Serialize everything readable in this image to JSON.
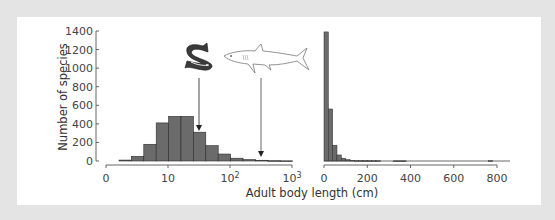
{
  "chart_data": [
    {
      "type": "bar",
      "panel": "left",
      "title": "",
      "xlabel": "Adult body length (cm)",
      "ylabel": "Number of species",
      "x_scale": "log",
      "x_tick_labels": [
        "0",
        "10",
        "10²",
        "10³"
      ],
      "y_tick_labels": [
        "0",
        "200",
        "400",
        "600",
        "800",
        "1000",
        "1200",
        "1400"
      ],
      "ylim": [
        0,
        1400
      ],
      "grid": false,
      "categories": [
        "b1",
        "b2",
        "b3",
        "b4",
        "b5",
        "b6",
        "b7",
        "b8",
        "b9",
        "b10",
        "b11",
        "b12",
        "b13",
        "b14"
      ],
      "values": [
        10,
        50,
        180,
        410,
        480,
        480,
        310,
        165,
        75,
        30,
        15,
        8,
        4,
        2
      ],
      "annotations": [
        {
          "label": "fish (salmon)",
          "arrow_to_bar": 7
        },
        {
          "label": "shark",
          "arrow_to_bar": 12
        }
      ]
    },
    {
      "type": "bar",
      "panel": "right",
      "title": "",
      "xlabel": "Adult body length (cm)",
      "ylabel": "Number of species",
      "x_scale": "linear",
      "x_tick_labels": [
        "0",
        "200",
        "400",
        "600",
        "800"
      ],
      "xlim": [
        0,
        850
      ],
      "ylim": [
        0,
        1400
      ],
      "bin_width": 20,
      "x": [
        0,
        20,
        40,
        60,
        80,
        100,
        120,
        140,
        160,
        180,
        200,
        220,
        240,
        320,
        340,
        360,
        760
      ],
      "values": [
        1390,
        560,
        170,
        65,
        30,
        15,
        8,
        5,
        5,
        4,
        4,
        3,
        3,
        2,
        2,
        2,
        3
      ]
    }
  ],
  "labels": {
    "ylabel": "Number of species",
    "xlabel": "Adult body length (cm)",
    "left_y_ticks": [
      "1400",
      "1200",
      "1000",
      "800",
      "600",
      "400",
      "200",
      "0"
    ],
    "left_x_ticks": [
      "0",
      "10",
      "10",
      "10"
    ],
    "left_x_ticks_exp": [
      "",
      "",
      "2",
      "3"
    ],
    "right_x_ticks": [
      "0",
      "200",
      "400",
      "600",
      "800"
    ]
  },
  "colors": {
    "bar_fill": "#6b6b6b",
    "bar_edge": "#2a2a2a",
    "axis": "#555555",
    "background": "#e4e4e4",
    "panel": "#ffffff"
  },
  "icons": {
    "fish": "salmon-illustration",
    "shark": "shark-illustration"
  }
}
